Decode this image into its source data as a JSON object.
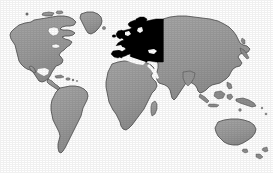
{
  "figure": {
    "kind": "world-map",
    "title": "World map with Europe highlighted",
    "projection_note": "flat rectangular world map, scanned grayscale print",
    "caption": "",
    "labels_visible": false
  },
  "colors": {
    "background": "#ffffff",
    "ocean": "#ffffff",
    "land_fill": "#9d9d9d",
    "land_fill_shade": "#8e8e8e",
    "land_outline": "#4a4a4a",
    "highlight_fill": "#000000",
    "top_rule": "#a8a8a8",
    "top_rule_soft": "#e2e2e2",
    "right_rule": "#d8d8d8"
  },
  "legend": {
    "visible": false,
    "entries": [
      {
        "swatch": "#000000",
        "label": "Highlighted region (Europe)"
      },
      {
        "swatch": "#9d9d9d",
        "label": "Other land"
      },
      {
        "swatch": "#ffffff",
        "label": "Ocean"
      }
    ]
  },
  "highlight": {
    "name": "Europe",
    "fill": "#000000",
    "extent_px": {
      "x": 108,
      "y": 19,
      "width": 56,
      "height": 44
    },
    "includes": [
      "Scandinavia",
      "British Isles",
      "Iberian Peninsula",
      "France",
      "Central Europe",
      "Italy",
      "Balkans",
      "Western Russia"
    ]
  },
  "landmasses": [
    {
      "name": "North America",
      "fill": "#9d9d9d"
    },
    {
      "name": "Greenland",
      "fill": "#9d9d9d"
    },
    {
      "name": "Iceland",
      "fill": "#9d9d9d"
    },
    {
      "name": "Central America",
      "fill": "#9d9d9d"
    },
    {
      "name": "Caribbean",
      "fill": "#9d9d9d"
    },
    {
      "name": "South America",
      "fill": "#9d9d9d"
    },
    {
      "name": "Africa",
      "fill": "#9d9d9d"
    },
    {
      "name": "Madagascar",
      "fill": "#9d9d9d"
    },
    {
      "name": "Europe",
      "fill": "#000000"
    },
    {
      "name": "Asia",
      "fill": "#9d9d9d"
    },
    {
      "name": "Arabian Peninsula",
      "fill": "#9d9d9d"
    },
    {
      "name": "India",
      "fill": "#9d9d9d"
    },
    {
      "name": "Japan",
      "fill": "#9d9d9d"
    },
    {
      "name": "Southeast Asian Islands",
      "fill": "#9d9d9d"
    },
    {
      "name": "Australia",
      "fill": "#9d9d9d"
    },
    {
      "name": "New Zealand",
      "fill": "#9d9d9d"
    }
  ]
}
